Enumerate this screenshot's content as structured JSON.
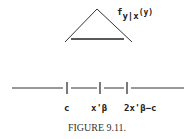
{
  "figure": {
    "density_label": {
      "f": "f",
      "sub": "y|x",
      "arg": "(y)"
    },
    "axis_labels": [
      "c",
      "x'β",
      "2x'β−c"
    ],
    "caption": "FIGURE 9.11."
  }
}
